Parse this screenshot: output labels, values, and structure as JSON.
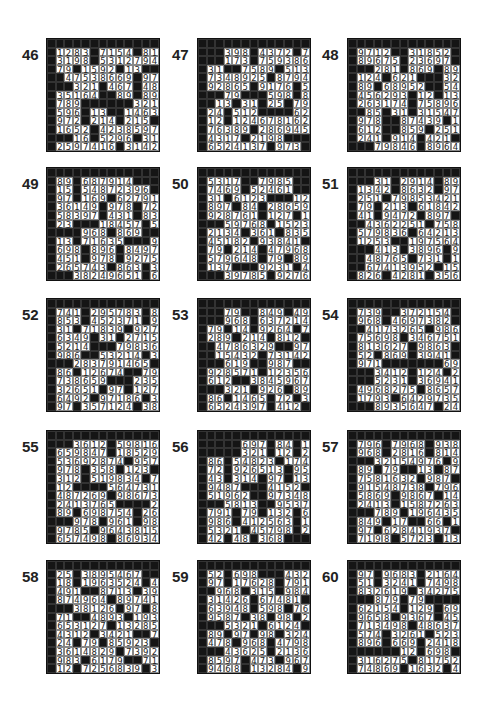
{
  "page": {
    "puzzles": [
      {
        "number": "46",
        "rows": [
          "#############",
          "#1283#7154#81",
          "#3198#5312794",
          "#79#1592#13##",
          "##47538669#9753",
          "###321#467#487",
          "#35164##89#896",
          "#789######321",
          "#596#13##14632",
          "#972#214#215##",
          "#1652#42385 97",
          "###16#5296#31",
          "#25974 16#3142",
          "#13#4231#8297"
        ]
      },
      {
        "number": "47",
        "rows": [
          "#############",
          "###398#4372#79",
          "###173#759386 4",
          "#31##7589#5132",
          "#7348925#87941",
          "#92865#9176#58",
          "###79###598#87",
          "##13#31#25#79#",
          "#24#512####62#",
          "#12#12467816 2",
          "#76389#286945 1",
          "#4317#2198###94",
          "#652413 7#973##",
          "#97#9368#421##"
        ]
      },
      {
        "number": "48",
        "rows": [
          "#############",
          "#97 12##31852#",
          "#896 75#23697#",
          "###281#869#894",
          "#124#621###321",
          "#89#68952##542",
          "#456293#12#13#",
          "#263174#758964",
          "##85#31#315472",
          "#978##87439#13",
          "#612##859#251",
          "#241#914#421##",
          "###79846#89643",
          "###45629##5321"
        ]
      },
      {
        "number": "49",
        "rows": [
          "#############",
          "#89#687914###",
          "#15#5487 2396#",
          "#97#169#627913",
          "#36149#978#721",
          "#58397#431#839",
          "#23###18457#58",
          "####968#869###",
          "#13#71635###94",
          "#698#896#84975",
          "#451#978#92753",
          "#265743#863#32",
          "###38249651#61",
          "####358976#87"
        ]
      },
      {
        "number": "50",
        "rows": [
          "#############",
          "#5317##7985##",
          "#7469#52461##",
          "#31#6123###125",
          "#897#84#286597",
          "#928761#127#13",
          "###59768#15234",
          "#2134#361#8359",
          "#45182#93841##",
          "#79#214#479681",
          "#579648#79#893",
          "#137###9231#42",
          "###39785#9276",
          "###1742##3164"
        ]
      },
      {
        "number": "51",
        "rows": [
          "#############",
          "###31#2914#893",
          "#1342#8632#971",
          "#251#79853421#",
          "#79#213#61842#",
          "#41#9472#897##",
          "##4362251#7589",
          "#579836#642137",
          "#1253##19756 4#",
          "###413#3896#95",
          "##48765#731#13",
          "##6741395 2#152",
          "#826#4281#3561",
          "#412#2163#12##"
        ]
      },
      {
        "number": "52",
        "rows": [
          "#############",
          "#741#295783#81",
          "#853#452371#94",
          "#31#71839#9278",
          "#6349#31#27153",
          "#5214###798365",
          "#986##53214#32",
          "###2837914 65##",
          "#86#126 74##795",
          "#73865 9###2351",
          "#32651#97#1274",
          "#6492#97186#32",
          "#97#357124#387",
          "#51#798546#163"
        ]
      },
      {
        "number": "53",
        "rows": [
          "#############",
          "###79##849#498",
          "###968#637 2145",
          "#79#14#9264#79",
          "#289#214#812##",
          "##47863 29##978",
          "##15432#7314 26",
          "###619##987##",
          "#928571#12356#",
          "#612##3845967#",
          "###321#926#893",
          "#86#1465#72#31",
          "#652439 7#412##",
          "#986#286##48##"
        ]
      },
      {
        "number": "54",
        "rows": [
          "#############",
          "#739##37215 4##",
          "#968#46973 82##",
          "##4173265#9867",
          "#75698#3467512",
          "#813627#9863##",
          "#52#869#3941##",
          "#971#######698",
          "###3412#124#21",
          "###5231#369415",
          "#4968275#86579",
          "#1793#6429735#",
          "###893564 7#241",
          "###752431##163"
        ]
      },
      {
        "number": "55",
        "rows": [
          "#############",
          "###3612#598164",
          "#659847#185293",
          "#53692874#9578",
          "#978#358#123##",
          "#312#51983 4#79",
          "#12####5647312",
          "#487269#986735",
          "#2413765####28",
          "#89#698754#263",
          "###978#961#986",
          "#9785#96438157",
          "#657498#869341",
          "#723156#9265##"
        ]
      },
      {
        "number": "56",
        "rows": [
          "#############",
          "#####697#84#13",
          "#####321#12#25",
          "#86#54823#1749",
          "#72#926513#958",
          "#43#314#97#137",
          "#9487###4152##",
          "#51962##97348",
          "###5813##9537",
          "#791#79#132#69",
          "#986#412563#13",
          "#5321#45798#25",
          "#42#48#368####",
          "#61#29#137####"
        ]
      },
      {
        "number": "57",
        "rows": [
          "#############",
          "#796#7968#9381",
          "#968#2816#8142",
          "###3215497 6#95",
          "#89#79##13#873",
          "#7581632#987##",
          "#9154873 8#7968",
          "#5869#9867#1425",
          "#2413#15872639",
          "###789#1964357",
          "#849#17##66#13",
          "#97#628419 37##",
          "#7198#5723#137",
          "#3274#9845#412"
        ]
      },
      {
        "number": "58",
        "rows": [
          "#############",
          "#25#3895467###",
          "#18#1963524#43",
          "#491##87 13#397",
          "#874964#8974165",
          "###3812 6#97#89",
          "#71##4893#1932",
          "#65312 7#132854",
          "#4312#3421##71",
          "#24#79#85923###",
          "#36148 29#739 24",
          "#983#6179##712",
          "#12#72568 39#31",
          "###24356 18#89"
        ]
      },
      {
        "number": "59",
        "rows": [
          "#############",
          "#52#698###4321",
          "#97#176 28#7913",
          "##968#315#9846",
          "#31426#67481##",
          "#63948#598#764",
          "#9587#38#98#21",
          "###5321#6124##",
          "#89#97#98#3241",
          "#478#968#47986",
          "###43625#21364",
          "#8597#473#967#",
          "#9468#13284#96",
          "#6274##896#31"
        ]
      },
      {
        "number": "60",
        "rows": [
          "#############",
          "#97#9683#21643",
          "#51#3241#74985",
          "#832619#342751",
          "###879#79#####",
          "#62154#129#698",
          "#9658#9367#452",
          "#713498#486379",
          "#574#3261#5231",
          "#896#669#24183",
          "######12#698##",
          "#316275#817529",
          "#74869#1632#48",
          "#53916#3948#15"
        ]
      }
    ]
  }
}
